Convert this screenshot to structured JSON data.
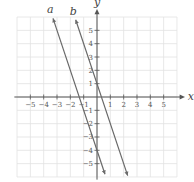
{
  "chart_data": {
    "type": "line",
    "title": "",
    "xlabel": "x",
    "ylabel": "y",
    "xlim": [
      -6,
      6
    ],
    "ylim": [
      -6,
      6
    ],
    "grid": true,
    "x_ticks": [
      -5,
      -4,
      -3,
      -2,
      -1,
      1,
      2,
      3,
      4,
      5
    ],
    "y_ticks": [
      -5,
      -4,
      -3,
      -2,
      -1,
      1,
      2,
      3,
      4,
      5
    ],
    "series": [
      {
        "name": "a",
        "equation": "y = -3x - 4",
        "slope": -3,
        "intercept": -4,
        "x_range": [
          -3.3,
          0.6
        ]
      },
      {
        "name": "b",
        "equation": "y = -3x + 1",
        "slope": -3,
        "intercept": 1,
        "x_range": [
          -1.6,
          2.3
        ]
      }
    ]
  },
  "colors": {
    "grid": "#e2e2e2",
    "axis": "#555555",
    "line": "#6a6a6a"
  }
}
